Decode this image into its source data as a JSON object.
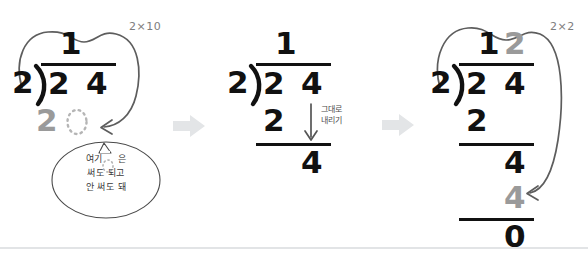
{
  "figure": {
    "background_color": "#ffffff",
    "ink_color": "#111111",
    "hint_color": "#9a9a9a",
    "label_color": "#7d7d7d",
    "separator_color": "#e2e4e6"
  },
  "steps": [
    {
      "id": "step-1",
      "divisor": "2",
      "dividend_tens": "2",
      "dividend_ones": "4",
      "quotient_tens": "1",
      "quotient_ones": "",
      "partial_product": "2",
      "placeholder": "○",
      "mult_label": "2×10",
      "bubble": {
        "line1": "여기 ○은",
        "line2": "써도 되고",
        "line3": "안 써도 돼"
      }
    },
    {
      "id": "step-2",
      "divisor": "2",
      "dividend_tens": "2",
      "dividend_ones": "4",
      "quotient_tens": "1",
      "quotient_ones": "",
      "partial_product": "2",
      "remainder_bring_down": "4",
      "note_line1": "그대로",
      "note_line2": "내리기"
    },
    {
      "id": "step-3",
      "divisor": "2",
      "dividend_tens": "2",
      "dividend_ones": "4",
      "quotient_tens": "1",
      "quotient_ones": "2",
      "partial_product": "2",
      "remainder_bring_down": "4",
      "second_product": "4",
      "final_remainder": "0",
      "mult_label": "2×2"
    }
  ],
  "separators": [
    {
      "id": "separator-1",
      "icon": "right-arrow-icon"
    },
    {
      "id": "separator-2",
      "icon": "right-arrow-icon"
    }
  ]
}
